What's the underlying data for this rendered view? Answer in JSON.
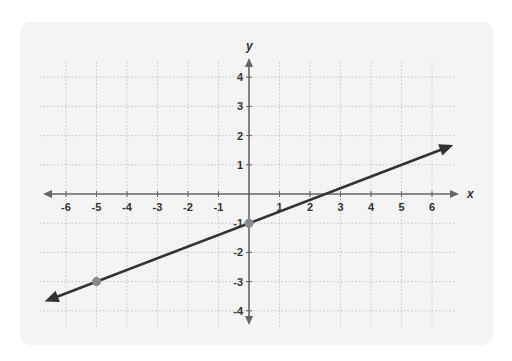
{
  "chart_data": {
    "type": "line",
    "title": "",
    "xlabel": "x",
    "ylabel": "y",
    "xlim": [
      -6,
      6
    ],
    "ylim": [
      -4,
      4
    ],
    "x_ticks": [
      -6,
      -5,
      -4,
      -3,
      -2,
      -1,
      1,
      2,
      3,
      4,
      5,
      6
    ],
    "y_ticks": [
      4,
      3,
      2,
      1,
      -1,
      -2,
      -3,
      -4
    ],
    "grid": true,
    "grid_style": "dotted",
    "series": [
      {
        "name": "line",
        "equation": "y = 0.4x - 1",
        "slope": 0.4,
        "intercept": -1,
        "x_range": [
          -6.7,
          6.7
        ],
        "arrows_both_ends": true,
        "color": "#333333"
      }
    ],
    "points": [
      {
        "x": 0,
        "y": -1,
        "color": "#8a8a8a"
      },
      {
        "x": -5,
        "y": -3,
        "color": "#8a8a8a"
      }
    ]
  },
  "colors": {
    "card_bg": "#f4f4f4",
    "axis": "#666666",
    "grid": "#c8c8c8",
    "text": "#333333",
    "line": "#333333",
    "point": "#8a8a8a"
  }
}
